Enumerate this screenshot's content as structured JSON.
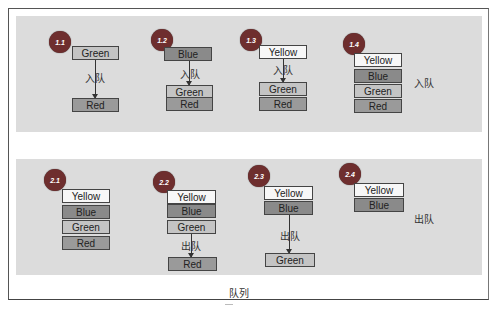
{
  "title": "队列",
  "enqueue_label": "入队",
  "dequeue_label": "出队",
  "colors": {
    "panel": "#dcdcdc",
    "badge": "#6e2e2e",
    "yellow": "#f7f7f7",
    "blue": "#8a8a8a",
    "green": "#c4c4c4",
    "red": "#9a9a9a"
  },
  "row1": {
    "steps": [
      {
        "badge": "1.1",
        "top": "Green",
        "bottom": [
          "Red"
        ],
        "arrow_label": "入队"
      },
      {
        "badge": "1.2",
        "top": "Blue",
        "bottom": [
          "Green",
          "Red"
        ],
        "arrow_label": "入队"
      },
      {
        "badge": "1.3",
        "top": "Yellow",
        "bottom": [
          "Green",
          "Red"
        ],
        "arrow_label": "入队"
      },
      {
        "badge": "1.4",
        "stack": [
          "Yellow",
          "Blue",
          "Green",
          "Red"
        ],
        "side_label": "入队"
      }
    ]
  },
  "row2": {
    "steps": [
      {
        "badge": "2.1",
        "stack": [
          "Yellow",
          "Blue",
          "Green",
          "Red"
        ]
      },
      {
        "badge": "2.2",
        "stack": [
          "Yellow",
          "Blue",
          "Green"
        ],
        "out": "Red",
        "arrow_label": "出队"
      },
      {
        "badge": "2.3",
        "stack": [
          "Yellow",
          "Blue"
        ],
        "out": "Green",
        "arrow_label": "出队"
      },
      {
        "badge": "2.4",
        "stack": [
          "Yellow",
          "Blue"
        ],
        "side_label": "出队"
      }
    ]
  }
}
